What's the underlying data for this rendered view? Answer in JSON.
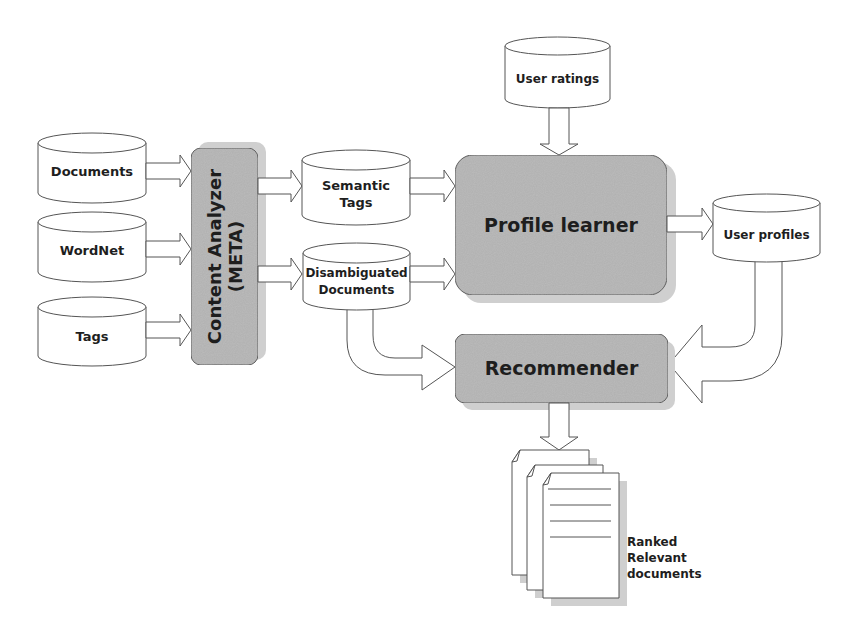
{
  "diagram": {
    "colors": {
      "box_fill": "#b5b5b5",
      "box_shadow": "#cfcfcf",
      "stroke": "#555555",
      "background": "#ffffff",
      "text": "#1e1e1e"
    },
    "sources": [
      {
        "id": "documents",
        "label": "Documents"
      },
      {
        "id": "wordnet",
        "label": "WordNet"
      },
      {
        "id": "tags",
        "label": "Tags"
      }
    ],
    "content_analyzer": {
      "line1": "Content Analyzer",
      "line2": "(META)"
    },
    "intermediate": [
      {
        "id": "semantic-tags",
        "line1": "Semantic",
        "line2": "Tags"
      },
      {
        "id": "disambiguated-documents",
        "line1": "Disambiguated",
        "line2": "Documents"
      }
    ],
    "user_ratings": {
      "label": "User ratings"
    },
    "profile_learner": {
      "label": "Profile learner"
    },
    "user_profiles": {
      "label": "User profiles"
    },
    "recommender": {
      "label": "Recommender"
    },
    "output": {
      "line1": "Ranked",
      "line2": "Relevant",
      "line3": "documents"
    },
    "edges": [
      {
        "from": "Documents",
        "to": "Content Analyzer (META)"
      },
      {
        "from": "WordNet",
        "to": "Content Analyzer (META)"
      },
      {
        "from": "Tags",
        "to": "Content Analyzer (META)"
      },
      {
        "from": "Content Analyzer (META)",
        "to": "Semantic Tags"
      },
      {
        "from": "Content Analyzer (META)",
        "to": "Disambiguated Documents"
      },
      {
        "from": "Semantic Tags",
        "to": "Profile learner"
      },
      {
        "from": "Disambiguated Documents",
        "to": "Profile learner"
      },
      {
        "from": "User ratings",
        "to": "Profile learner"
      },
      {
        "from": "Profile learner",
        "to": "User profiles"
      },
      {
        "from": "Disambiguated Documents",
        "to": "Recommender"
      },
      {
        "from": "User profiles",
        "to": "Recommender"
      },
      {
        "from": "Recommender",
        "to": "Ranked Relevant documents"
      }
    ]
  }
}
